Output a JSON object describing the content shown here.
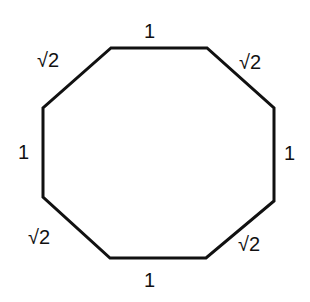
{
  "diagram": {
    "shape": "octagon",
    "stroke_color": "#111111",
    "vertices": [
      [
        111,
        48
      ],
      [
        207,
        48
      ],
      [
        274,
        108
      ],
      [
        274,
        201
      ],
      [
        206,
        258
      ],
      [
        110,
        258
      ],
      [
        43,
        197
      ],
      [
        43,
        108
      ]
    ],
    "labels": {
      "top": "1",
      "top_right": "√2",
      "right": "1",
      "bottom_right": "√2",
      "bottom": "1",
      "bottom_left": "√2",
      "left": "1",
      "top_left": "√2"
    }
  }
}
